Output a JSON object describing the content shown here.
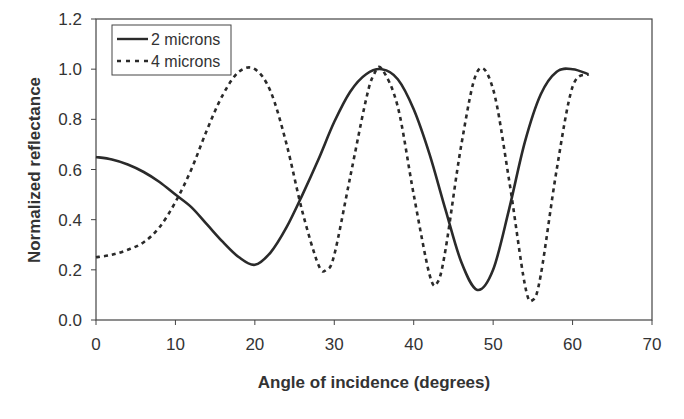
{
  "chart_data": {
    "type": "line",
    "title": "",
    "xlabel": "Angle of incidence (degrees)",
    "ylabel": "Normalized reflectance",
    "xlim": [
      0,
      70
    ],
    "ylim": [
      0,
      1.2
    ],
    "xticks": [
      "0",
      "10",
      "20",
      "30",
      "40",
      "50",
      "60",
      "70"
    ],
    "yticks": [
      "0.0",
      "0.2",
      "0.4",
      "0.6",
      "0.8",
      "1.0",
      "1.2"
    ],
    "grid": false,
    "legend_position": "upper-left",
    "series": [
      {
        "name": "2 microns",
        "style": "solid",
        "x": [
          0,
          2,
          4,
          6,
          8,
          10,
          12,
          14,
          16,
          18,
          20,
          22,
          24,
          26,
          28,
          30,
          32,
          34,
          36,
          38,
          40,
          42,
          44,
          46,
          48,
          50,
          52,
          54,
          56,
          58,
          60,
          62
        ],
        "y": [
          0.65,
          0.64,
          0.62,
          0.59,
          0.55,
          0.5,
          0.45,
          0.38,
          0.31,
          0.25,
          0.22,
          0.27,
          0.37,
          0.5,
          0.64,
          0.79,
          0.91,
          0.98,
          1.0,
          0.96,
          0.84,
          0.66,
          0.44,
          0.23,
          0.12,
          0.2,
          0.44,
          0.71,
          0.9,
          0.99,
          1.0,
          0.98
        ]
      },
      {
        "name": "4 microns",
        "style": "dashed",
        "x": [
          0,
          2,
          4,
          6,
          8,
          10,
          12,
          14,
          16,
          18,
          20,
          22,
          24,
          26,
          28,
          29,
          30,
          32,
          34,
          35,
          36,
          38,
          40,
          42,
          43,
          44,
          46,
          48,
          50,
          52,
          54,
          55,
          56,
          58,
          60,
          62
        ],
        "y": [
          0.25,
          0.26,
          0.28,
          0.31,
          0.37,
          0.47,
          0.6,
          0.76,
          0.9,
          0.99,
          1.0,
          0.91,
          0.7,
          0.43,
          0.22,
          0.2,
          0.26,
          0.57,
          0.88,
          0.98,
          1.0,
          0.85,
          0.5,
          0.18,
          0.15,
          0.28,
          0.7,
          0.99,
          0.92,
          0.56,
          0.14,
          0.08,
          0.18,
          0.6,
          0.93,
          0.98
        ]
      }
    ]
  },
  "legend": {
    "items": [
      {
        "label": "2 microns",
        "style": "solid"
      },
      {
        "label": "4 microns",
        "style": "dashed"
      }
    ]
  },
  "colors": {
    "line": "#2a2a2a",
    "axis": "#444444",
    "text": "#333333",
    "background": "#ffffff"
  }
}
